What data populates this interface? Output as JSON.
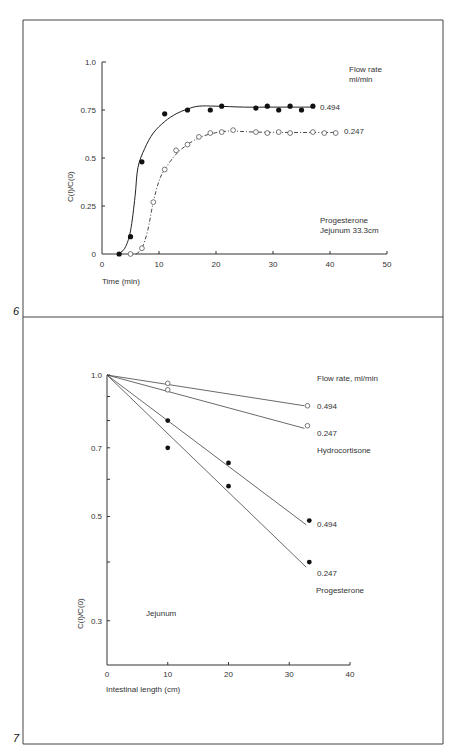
{
  "figure_numbers": {
    "fig6": "6",
    "fig7": "7"
  },
  "chart_data": [
    {
      "id": "fig6",
      "type": "scatter",
      "title": "",
      "xlabel": "Time (min)",
      "ylabel": "C(l)/C(0)",
      "xlim": [
        0,
        50
      ],
      "ylim": [
        0,
        1.0
      ],
      "x_ticks": [
        "0",
        "10",
        "20",
        "30",
        "40",
        "50"
      ],
      "y_ticks": [
        "0",
        "0.25",
        "0.5",
        "0.75",
        "1.0"
      ],
      "grid": false,
      "legend_title": [
        "Flow rate",
        "ml/min"
      ],
      "annotation": [
        "Progesterone",
        "Jejunum 33.3cm"
      ],
      "series": [
        {
          "name": "0.494",
          "marker": "filled-circle",
          "line": "solid smooth curve",
          "x": [
            3,
            5,
            7,
            11,
            15,
            19,
            21,
            27,
            29,
            31,
            33,
            35,
            37
          ],
          "y": [
            0,
            0.09,
            0.48,
            0.73,
            0.75,
            0.75,
            0.77,
            0.76,
            0.77,
            0.75,
            0.77,
            0.75,
            0.77
          ]
        },
        {
          "name": "0.247",
          "marker": "open-circle",
          "line": "dash-dot smooth curve",
          "x": [
            5,
            7,
            9,
            11,
            13,
            15,
            17,
            19,
            21,
            23,
            27,
            29,
            31,
            33,
            37,
            39,
            41
          ],
          "y": [
            0,
            0.03,
            0.27,
            0.44,
            0.54,
            0.57,
            0.61,
            0.63,
            0.635,
            0.645,
            0.635,
            0.63,
            0.635,
            0.63,
            0.635,
            0.63,
            0.63
          ]
        }
      ]
    },
    {
      "id": "fig7",
      "type": "line",
      "title": "",
      "xlabel": "Intestinal length (cm)",
      "ylabel": "C(l)/C(0)",
      "yscale": "log",
      "xlim": [
        0,
        40
      ],
      "ylim": [
        0.25,
        1.0
      ],
      "x_ticks": [
        "0",
        "10",
        "20",
        "30",
        "40"
      ],
      "y_ticks": [
        "0.3",
        "0.5",
        "0.7",
        "1.0"
      ],
      "y_minor_ticks": [
        0.4,
        0.6,
        0.8,
        0.9
      ],
      "grid": false,
      "legend_title": "Flow rate, ml/min",
      "annotation": "Jejunum",
      "groups": [
        "Hydrocortisone",
        "Progesterone"
      ],
      "series": [
        {
          "name": "0.494",
          "group": "Hydrocortisone",
          "marker": "open-circle",
          "x": [
            0,
            10,
            33
          ],
          "y": [
            1.0,
            0.96,
            0.86
          ],
          "fit_end": [
            32.5,
            0.86
          ]
        },
        {
          "name": "0.247",
          "group": "Hydrocortisone",
          "marker": "open-circle",
          "x": [
            0,
            10,
            33
          ],
          "y": [
            1.0,
            0.93,
            0.78
          ],
          "fit_end": [
            32.5,
            0.77
          ]
        },
        {
          "name": "0.494",
          "group": "Progesterone",
          "marker": "filled-circle",
          "x": [
            0,
            10,
            20,
            33.3
          ],
          "y": [
            1.0,
            0.8,
            0.65,
            0.49
          ],
          "fit_end": [
            32.8,
            0.48
          ]
        },
        {
          "name": "0.247",
          "group": "Progesterone",
          "marker": "filled-circle",
          "x": [
            0,
            10,
            20,
            33.3
          ],
          "y": [
            1.0,
            0.7,
            0.58,
            0.4
          ],
          "fit_end": [
            32.8,
            0.39
          ]
        }
      ]
    }
  ]
}
